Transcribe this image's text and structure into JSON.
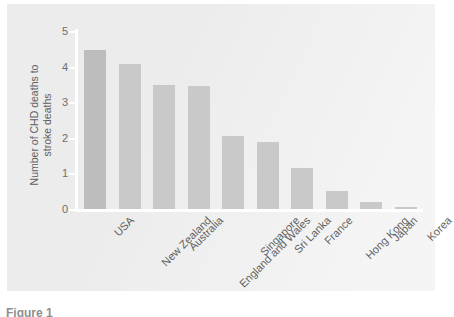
{
  "figure": {
    "panel_background": "#ececec",
    "page_background": "#ffffff",
    "axis_color": "#ffffff",
    "bar_color": "#c9c9c9",
    "bar_color_highlight": "#bdbdbd",
    "text_color": "#5f5f5f",
    "caption_partial": "Figure 1"
  },
  "chart_data": {
    "type": "bar",
    "title": "",
    "xlabel": "",
    "ylabel": "Number of CHD deaths to stroke deaths",
    "ylabel_lines": [
      "Number of CHD deaths to",
      "stroke deaths"
    ],
    "ylim": [
      0,
      5
    ],
    "yticks": [
      0,
      1,
      2,
      3,
      4,
      5
    ],
    "ytick_labels": [
      "0",
      "1",
      "2",
      "3",
      "4",
      "5"
    ],
    "grid": false,
    "legend": false,
    "legend_position": "none",
    "categories": [
      "USA",
      "New Zealand",
      "Australia",
      "England and Wales",
      "Singapore",
      "Sri Lanka",
      "France",
      "Hong Kong",
      "Japan",
      "Korea"
    ],
    "values": [
      4.48,
      4.07,
      3.47,
      3.45,
      2.05,
      1.88,
      1.15,
      0.5,
      0.2,
      0.05
    ],
    "series": [
      {
        "name": "CHD to stroke death ratio",
        "values": [
          4.48,
          4.07,
          3.47,
          3.45,
          2.05,
          1.88,
          1.15,
          0.5,
          0.2,
          0.05
        ]
      }
    ]
  }
}
